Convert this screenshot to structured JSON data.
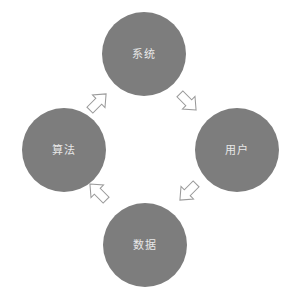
{
  "diagram": {
    "background_color": "#ffffff",
    "node_fill_color": "#7d7d7d",
    "node_text_color": "#e8e8e8",
    "arrow_fill_color": "#ffffff",
    "arrow_stroke_color": "#9a9a9a",
    "nodes": [
      {
        "id": "top",
        "label": "系统",
        "name": "node-system"
      },
      {
        "id": "right",
        "label": "用户",
        "name": "node-user"
      },
      {
        "id": "bottom",
        "label": "数据",
        "name": "node-data"
      },
      {
        "id": "left",
        "label": "算法",
        "name": "node-algorithm"
      }
    ],
    "arrows": [
      {
        "id": "left-to-top",
        "from": "算法",
        "to": "系统",
        "direction": "up-right"
      },
      {
        "id": "top-to-right",
        "from": "系统",
        "to": "用户",
        "direction": "down-right"
      },
      {
        "id": "right-to-bottom",
        "from": "用户",
        "to": "数据",
        "direction": "down-left"
      },
      {
        "id": "bottom-to-left",
        "from": "数据",
        "to": "算法",
        "direction": "up-left"
      }
    ],
    "flow": "数据 → 算法 → 系统 → 用户 → 数据"
  }
}
